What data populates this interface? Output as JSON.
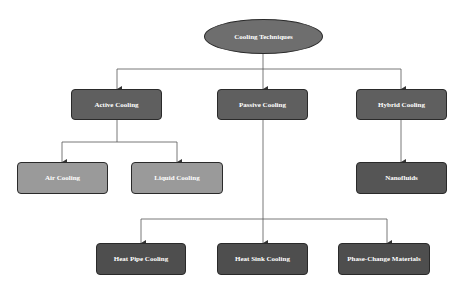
{
  "diagram": {
    "type": "tree",
    "root": {
      "id": "root",
      "label": "Cooling Techniques",
      "shape": "ellipse",
      "color": "#6e6e6e"
    },
    "nodes": [
      {
        "id": "active",
        "label": "Active Cooling",
        "color": "#5f5f5f"
      },
      {
        "id": "passive",
        "label": "Passive Cooling",
        "color": "#5f5f5f"
      },
      {
        "id": "hybrid",
        "label": "Hybrid Cooling",
        "color": "#5f5f5f"
      },
      {
        "id": "air",
        "label": "Air Cooling",
        "color": "#9a9a9a"
      },
      {
        "id": "liquid",
        "label": "Liquid Cooling",
        "color": "#9a9a9a"
      },
      {
        "id": "nano",
        "label": "Nanofluids",
        "color": "#555555"
      },
      {
        "id": "heatpipe",
        "label": "Heat Pipe Cooling",
        "color": "#4e4e4e"
      },
      {
        "id": "heatsink",
        "label": "Heat Sink Cooling",
        "color": "#4e4e4e"
      },
      {
        "id": "pcm",
        "label": "Phase-Change Materials",
        "color": "#4e4e4e"
      }
    ],
    "edges": [
      [
        "root",
        "active"
      ],
      [
        "root",
        "passive"
      ],
      [
        "root",
        "hybrid"
      ],
      [
        "active",
        "air"
      ],
      [
        "active",
        "liquid"
      ],
      [
        "hybrid",
        "nano"
      ],
      [
        "passive",
        "heatpipe"
      ],
      [
        "passive",
        "heatsink"
      ],
      [
        "passive",
        "pcm"
      ]
    ]
  }
}
